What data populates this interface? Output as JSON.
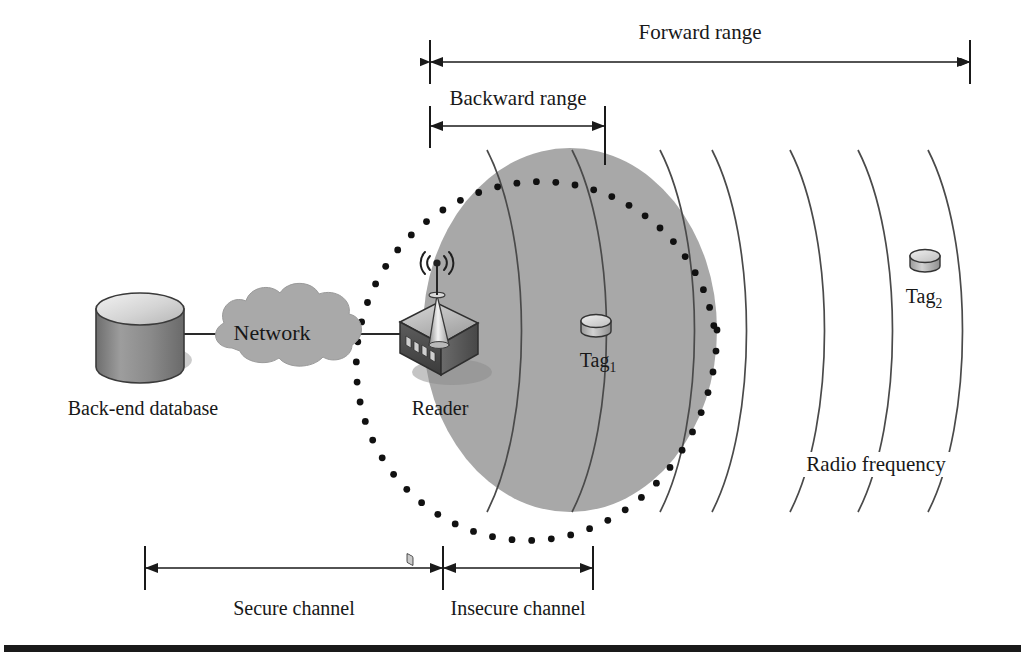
{
  "figure": {
    "colors": {
      "rf_zone_fill": "#a8a8a8",
      "stroke": "#1a1a1a",
      "cloud_fill": "#a9a9a9",
      "device_dark": "#4a4a4a",
      "device_light": "#d8d8d8",
      "baseline_rule": "#1a1a1a"
    }
  },
  "ranges": {
    "forward": {
      "label": "Forward range",
      "label_x": 700,
      "label_y": 33,
      "arrow_y": 62,
      "x1": 430,
      "x2": 970,
      "tick_top": 40,
      "tick_bottom": 84
    },
    "backward": {
      "label": "Backward range",
      "label_x": 518,
      "label_y": 95,
      "arrow_y": 126,
      "x1": 430,
      "x2": 605,
      "tick_top": 106,
      "tick_bottom": 148
    }
  },
  "channels": {
    "secure": {
      "label": "Secure channel",
      "label_x": 294,
      "label_y": 596,
      "arrow_y": 568,
      "x1": 145,
      "x2": 443,
      "tick_top": 546,
      "tick_bottom": 590
    },
    "insecure": {
      "label": "Insecure channel",
      "label_x": 518,
      "label_y": 596,
      "arrow_y": 568,
      "x1": 443,
      "x2": 593,
      "tick_top": 546,
      "tick_bottom": 590
    }
  },
  "nodes": {
    "database": {
      "label": "Back-end database",
      "label_x": 143,
      "label_y": 398,
      "cx": 140,
      "cy": 325,
      "rx": 44,
      "ry": 16,
      "body_height": 58
    },
    "network": {
      "label": "Network",
      "label_x": 272,
      "label_y": 323,
      "cx": 272,
      "cy": 334
    },
    "reader": {
      "label": "Reader",
      "label_x": 440,
      "label_y": 400,
      "cx": 437,
      "cy": 340
    },
    "tag1": {
      "label": "Tag",
      "subscript": "1",
      "label_x": 598,
      "label_y": 348,
      "icon_cx": 596,
      "icon_cy": 325
    },
    "tag2": {
      "label": "Tag",
      "subscript": "2",
      "label_x": 924,
      "label_y": 286,
      "icon_cx": 925,
      "icon_cy": 260
    }
  },
  "rf_field": {
    "label": "Radio frequency",
    "label_x": 876,
    "label_y": 452,
    "zone_cx": 570,
    "zone_cy": 330,
    "zone_rx": 147,
    "zone_ry": 182,
    "dot_count": 54,
    "dot_radius": 3.4,
    "arc_count": 7,
    "arc_top_y": 150,
    "arc_bottom_y": 512,
    "arc_x_positions": [
      487,
      572,
      660,
      712,
      790,
      858,
      928
    ],
    "arc_bulge": 46
  },
  "connections": {
    "db_to_cloud": {
      "x1": 184,
      "y1": 334,
      "x2": 224,
      "y2": 334
    },
    "cloud_to_reader": {
      "x1": 322,
      "y1": 334,
      "x2": 400,
      "y2": 334
    }
  },
  "baseline": {
    "y": 648,
    "x1": 4,
    "x2": 1021,
    "thickness": 7
  }
}
